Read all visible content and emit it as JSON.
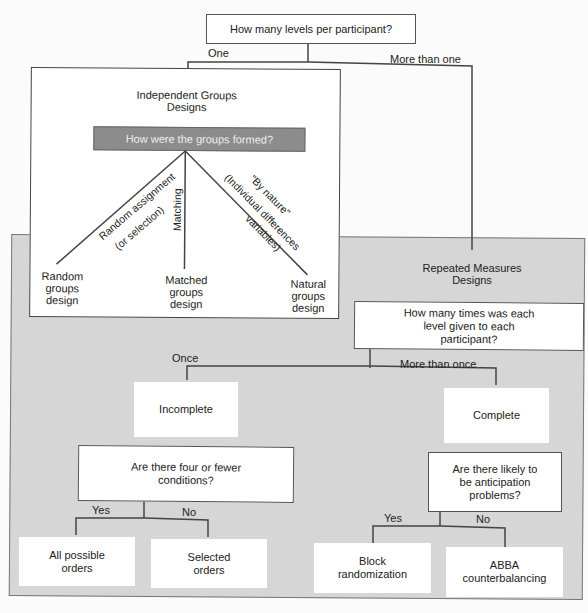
{
  "root": {
    "question": "How many levels per participant?",
    "branch_one": "One",
    "branch_more": "More than one"
  },
  "independent": {
    "title_line1": "Independent Groups",
    "title_line2": "Designs",
    "question": "How were the groups formed?",
    "branches": {
      "random_line1": "Random assignment",
      "random_line2": "(or selection)",
      "matching": "Matching",
      "nature_line1": "\"By nature\"",
      "nature_line2": "(Individual differences",
      "nature_line3": "variables)"
    },
    "outcomes": {
      "random": "Random groups design",
      "matched": "Matched groups design",
      "natural": "Natural groups design"
    },
    "header_color": "#8c8c8c"
  },
  "repeated": {
    "title_line1": "Repeated Measures",
    "title_line2": "Designs",
    "question": "How many times was each level given to each participant?",
    "branch_once": "Once",
    "branch_more": "More than once",
    "incomplete": "Incomplete",
    "complete": "Complete",
    "incomplete_question": "Are there four or fewer conditions?",
    "complete_question": "Are there likely to be anticipation problems?",
    "yes": "Yes",
    "no": "No",
    "outcomes": {
      "all_orders": "All possible orders",
      "selected_orders": "Selected orders",
      "block": "Block randomization",
      "abba": "ABBA counterbalancing"
    },
    "region_color": "#d6d6d6"
  }
}
